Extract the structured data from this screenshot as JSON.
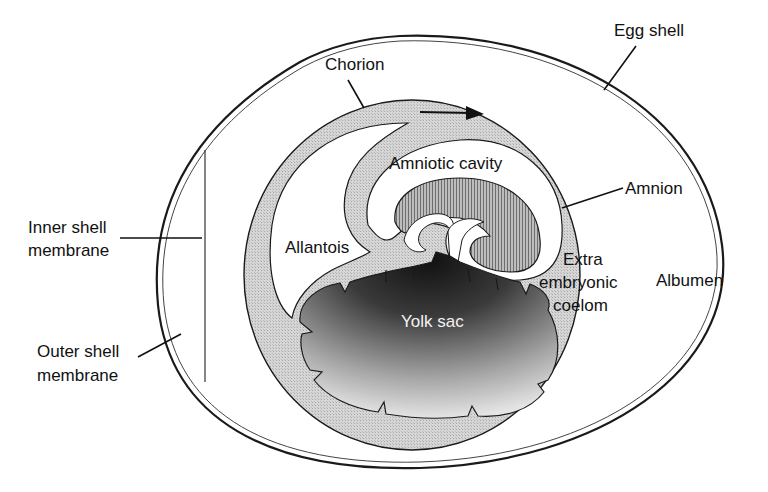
{
  "diagram": {
    "labels": {
      "egg_shell": "Egg shell",
      "chorion": "Chorion",
      "amniotic_cavity": "Amniotic cavity",
      "amnion": "Amnion",
      "inner_shell_membrane_line1": "Inner shell",
      "inner_shell_membrane_line2": "membrane",
      "allantois": "Allantois",
      "extra_embryonic_coelom_line1": "Extra",
      "extra_embryonic_coelom_line2": "embryonic",
      "extra_embryonic_coelom_line3": "coelom",
      "albumen": "Albumen",
      "yolk_sac": "Yolk sac",
      "outer_shell_membrane_line1": "Outer shell",
      "outer_shell_membrane_line2": "membrane"
    },
    "arrow_direction": "right",
    "colors": {
      "line": "#1a1a1a",
      "membrane_fill": "#d4d4d4",
      "embryo_fill": "#9a9a9a",
      "yolk_dark": "#1c1c1c",
      "yolk_light": "#e6e6e6",
      "background": "#ffffff"
    }
  }
}
